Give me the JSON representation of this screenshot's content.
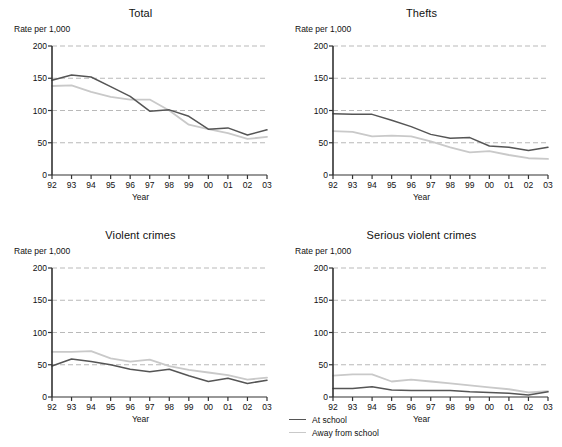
{
  "figure": {
    "series_colors": {
      "at_school": "#555555",
      "away_from_school": "#c9c9c9"
    },
    "grid_color": "#b9b9b9",
    "axis_color": "#333333"
  },
  "legend": {
    "items": [
      {
        "label": "At school",
        "color": "#555555"
      },
      {
        "label": "Away from school",
        "color": "#c9c9c9"
      }
    ]
  },
  "chart_data": [
    {
      "type": "line",
      "title": "Total",
      "xlabel": "Year",
      "ylabel": "Rate per 1,000",
      "x": [
        "92",
        "93",
        "94",
        "95",
        "96",
        "97",
        "98",
        "99",
        "00",
        "01",
        "02",
        "03"
      ],
      "yticks": [
        0,
        50,
        100,
        150,
        200
      ],
      "ylim": [
        0,
        200
      ],
      "grid": true,
      "legend_position": "figure-bottom-center",
      "series": [
        {
          "name": "At school",
          "values": [
            147,
            155,
            152,
            137,
            122,
            99,
            101,
            91,
            71,
            73,
            62,
            70
          ]
        },
        {
          "name": "Away from school",
          "values": [
            138,
            139,
            129,
            121,
            117,
            117,
            100,
            78,
            71,
            65,
            56,
            59
          ]
        }
      ]
    },
    {
      "type": "line",
      "title": "Thefts",
      "xlabel": "Year",
      "ylabel": "Rate per 1,000",
      "x": [
        "92",
        "93",
        "94",
        "95",
        "96",
        "97",
        "98",
        "99",
        "00",
        "01",
        "02",
        "03"
      ],
      "yticks": [
        0,
        50,
        100,
        150,
        200
      ],
      "ylim": [
        0,
        200
      ],
      "grid": true,
      "legend_position": "figure-bottom-center",
      "series": [
        {
          "name": "At school",
          "values": [
            95,
            94,
            94,
            85,
            75,
            63,
            57,
            58,
            45,
            43,
            38,
            43
          ]
        },
        {
          "name": "Away from school",
          "values": [
            68,
            67,
            60,
            61,
            60,
            52,
            43,
            35,
            37,
            31,
            26,
            25
          ]
        }
      ]
    },
    {
      "type": "line",
      "title": "Violent crimes",
      "xlabel": "Year",
      "ylabel": "Rate per 1,000",
      "x": [
        "92",
        "93",
        "94",
        "95",
        "96",
        "97",
        "98",
        "99",
        "00",
        "01",
        "02",
        "03"
      ],
      "yticks": [
        0,
        50,
        100,
        150,
        200
      ],
      "ylim": [
        0,
        200
      ],
      "grid": true,
      "legend_position": "figure-bottom-center",
      "series": [
        {
          "name": "At school",
          "values": [
            48,
            59,
            55,
            50,
            43,
            39,
            43,
            33,
            24,
            29,
            21,
            26
          ]
        },
        {
          "name": "Away from school",
          "values": [
            70,
            70,
            71,
            60,
            55,
            58,
            48,
            42,
            38,
            34,
            27,
            30
          ]
        }
      ]
    },
    {
      "type": "line",
      "title": "Serious violent crimes",
      "xlabel": "Year",
      "ylabel": "Rate per 1,000",
      "x": [
        "92",
        "93",
        "94",
        "95",
        "96",
        "97",
        "98",
        "99",
        "00",
        "01",
        "02",
        "03"
      ],
      "yticks": [
        0,
        50,
        100,
        150,
        200
      ],
      "ylim": [
        0,
        200
      ],
      "grid": true,
      "legend_position": "figure-bottom-center",
      "series": [
        {
          "name": "At school",
          "values": [
            13,
            13,
            16,
            11,
            10,
            10,
            10,
            8,
            7,
            6,
            3,
            8
          ]
        },
        {
          "name": "Away from school",
          "values": [
            33,
            35,
            35,
            24,
            27,
            24,
            21,
            18,
            15,
            12,
            7,
            9
          ]
        }
      ]
    }
  ]
}
